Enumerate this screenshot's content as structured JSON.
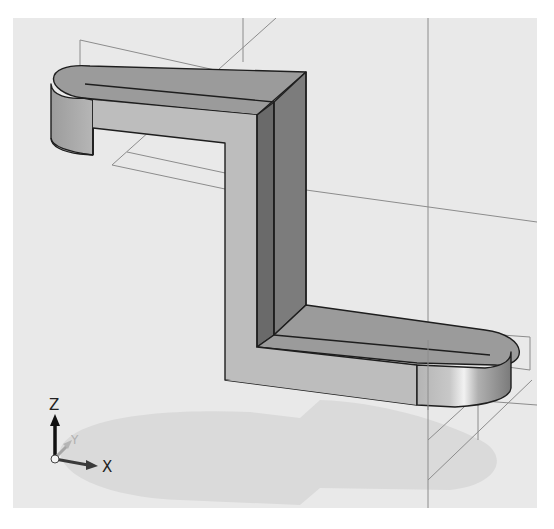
{
  "viewport": {
    "name": "3D model viewport",
    "background": "#e9e9e9",
    "model": "Z-shaped bracket solid with rounded ends (extruded, isometric view)",
    "shading": {
      "top_face": "#9a9a9a",
      "front_face": "#b9b9b9",
      "side_face_dark": "#6f6f6f",
      "edge_color": "#1e1e1e",
      "shadow": "#d6d6d6",
      "reference_geometry": "#8a8a8a"
    }
  },
  "triad": {
    "axes": [
      {
        "label": "Z",
        "direction": "up"
      },
      {
        "label": "Y",
        "direction": "back"
      },
      {
        "label": "X",
        "direction": "right"
      }
    ]
  }
}
